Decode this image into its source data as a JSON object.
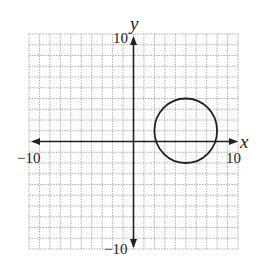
{
  "chart_data": {
    "type": "scatter",
    "title": "",
    "xlabel": "x",
    "ylabel": "y",
    "xlim": [
      -10,
      10
    ],
    "ylim": [
      -10,
      10
    ],
    "grid": true,
    "grid_step": 1,
    "tick_labels": {
      "x_min": "−10",
      "x_max": "10",
      "y_min": "−10",
      "y_max": "10"
    },
    "series": [
      {
        "name": "circle",
        "shape": "circle",
        "center": [
          5,
          1
        ],
        "radius": 3,
        "equation": "(x − 5)^2 + (y − 1)^2 = 9"
      }
    ]
  },
  "colors": {
    "grid": "#9a9a9a",
    "axis": "#222222",
    "curve": "#222222"
  }
}
